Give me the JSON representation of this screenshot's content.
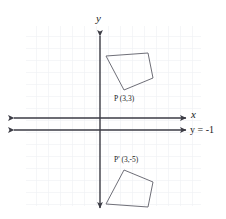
{
  "figure": {
    "kind": "coordinate-plane-reflection",
    "background_color": "#ffffff",
    "grid_color": "#eceef2",
    "axis_color": "#3b3b44",
    "shape_color": "#6f6f78",
    "text_color": "#1a1a1a",
    "grid": {
      "visible": true,
      "spacing_px": 12,
      "x_start_px": 26,
      "x_end_px": 201,
      "y_start_px": 26,
      "y_end_px": 206
    },
    "axes": {
      "y_axis_label": "y",
      "x_axis_label": "x",
      "x_axis_y_px": 118,
      "y_axis_x_px": 100,
      "double_arrow": true
    },
    "mirror_line": {
      "label": "y = -1",
      "equation_y_value": -1,
      "y_px": 130,
      "style": "solid-double-arrow"
    },
    "preimage": {
      "name": "preimage-polygon",
      "label": "P (3,3)",
      "label_point_name": "P",
      "label_coords": "(3,3)",
      "label_x_px": 114,
      "label_y_px": 99,
      "vertices_px": [
        [
          106,
          56
        ],
        [
          148,
          53
        ],
        [
          153,
          78
        ],
        [
          124,
          90
        ],
        [
          106,
          56
        ]
      ],
      "vertex_P_px": [
        124,
        90
      ]
    },
    "image": {
      "name": "image-polygon",
      "label": "P' (3,-5)",
      "label_point_name": "P'",
      "label_coords": "(3,-5)",
      "label_x_px": 114,
      "label_y_px": 161,
      "vertices_px": [
        [
          106,
          204
        ],
        [
          148,
          207
        ],
        [
          153,
          182
        ],
        [
          124,
          170
        ],
        [
          106,
          204
        ]
      ],
      "vertex_P_prime_px": [
        124,
        170
      ]
    }
  }
}
